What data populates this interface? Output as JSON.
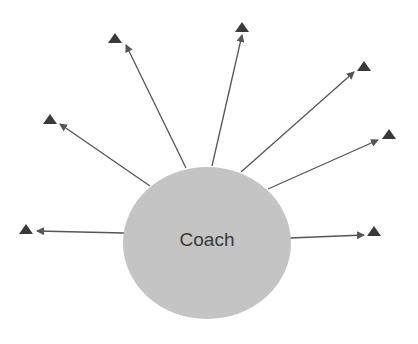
{
  "diagram": {
    "center": {
      "label": "Coach",
      "cx": 207,
      "cy": 243,
      "rx": 84,
      "ry": 76,
      "fill": "#c4c4c4"
    },
    "colors": {
      "line": "#555555",
      "marker": "#3a3a3a"
    },
    "spokes": [
      {
        "from": [
          124,
          233
        ],
        "to": [
          37,
          231
        ],
        "marker": [
          26,
          229
        ]
      },
      {
        "from": [
          150,
          186
        ],
        "to": [
          60,
          124
        ],
        "marker": [
          50,
          119
        ]
      },
      {
        "from": [
          186,
          168
        ],
        "to": [
          126,
          45
        ],
        "marker": [
          115,
          38
        ]
      },
      {
        "from": [
          212,
          166
        ],
        "to": [
          242,
          35
        ],
        "marker": [
          242,
          27
        ]
      },
      {
        "from": [
          241,
          172
        ],
        "to": [
          354,
          72
        ],
        "marker": [
          364,
          66
        ]
      },
      {
        "from": [
          268,
          189
        ],
        "to": [
          378,
          140
        ],
        "marker": [
          389,
          134
        ]
      },
      {
        "from": [
          290,
          238
        ],
        "to": [
          364,
          235
        ],
        "marker": [
          374,
          231
        ]
      }
    ]
  }
}
